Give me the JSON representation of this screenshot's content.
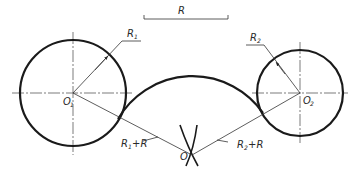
{
  "diagram": {
    "scale_bar": {
      "label": "R"
    },
    "labels": {
      "r1": {
        "main": "R",
        "sub": "1"
      },
      "r2": {
        "main": "R",
        "sub": "2"
      },
      "o1": {
        "main": "O",
        "sub": "1"
      },
      "o2": {
        "main": "O",
        "sub": "2"
      },
      "o": {
        "main": "O"
      },
      "r1_plus_r": {
        "main": "R",
        "sub": "1",
        "tail": "+R"
      },
      "r2_plus_r": {
        "main": "R",
        "sub": "2",
        "tail": "+R"
      }
    },
    "colors": {
      "line": "#1a1a1a",
      "thin": "#333333",
      "background": "#ffffff"
    }
  }
}
